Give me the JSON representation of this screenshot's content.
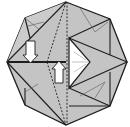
{
  "diagram": {
    "type": "origami-fold-step",
    "shape": "octagon",
    "colors": {
      "paper": "#c4c4c4",
      "paper_light": "#d0d0d0",
      "edge": "#1e1e1e",
      "crease": "#6a6a6a",
      "arrow_fill": "#ffffff",
      "flap_white": "#ffffff",
      "background": "#ffffff"
    },
    "arrows": [
      {
        "name": "push-down-arrow",
        "direction": "down"
      },
      {
        "name": "push-up-arrow",
        "direction": "up"
      }
    ],
    "lines": {
      "valley_fold": "dashed"
    }
  }
}
